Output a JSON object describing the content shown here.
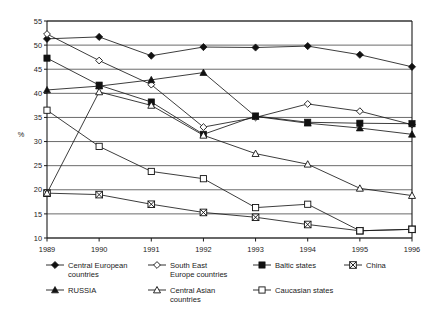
{
  "chart_data": {
    "type": "line",
    "title": "",
    "xlabel": "",
    "ylabel": "%",
    "categories": [
      "1989",
      "1990",
      "1991",
      "1992",
      "1993",
      "1994",
      "1995",
      "1996"
    ],
    "x": [
      1989,
      1990,
      1991,
      1992,
      1993,
      1994,
      1995,
      1996
    ],
    "ylim": [
      10,
      55
    ],
    "yticks": [
      "10",
      "15",
      "20",
      "25",
      "30",
      "35",
      "40",
      "45",
      "50",
      "55"
    ],
    "ytick_values": [
      10,
      15,
      20,
      25,
      30,
      35,
      40,
      45,
      50,
      55
    ],
    "grid": true,
    "legend_position": "bottom",
    "series": [
      {
        "name": "Central European countries",
        "marker": "diamond-filled",
        "values": [
          51.3,
          51.7,
          47.8,
          49.6,
          49.5,
          49.8,
          48.0,
          45.5
        ]
      },
      {
        "name": "South East Europe countries",
        "marker": "diamond-open",
        "values": [
          52.3,
          46.8,
          41.8,
          33.0,
          35.0,
          37.8,
          36.3,
          33.5
        ]
      },
      {
        "name": "Baltic states",
        "marker": "square-filled",
        "values": [
          47.3,
          41.7,
          38.2,
          31.5,
          35.3,
          34.0,
          33.8,
          33.7
        ]
      },
      {
        "name": "China",
        "marker": "square-crossed",
        "values": [
          19.3,
          19.0,
          17.0,
          15.3,
          14.3,
          12.8,
          11.5,
          11.8
        ]
      },
      {
        "name": "RUSSIA",
        "marker": "triangle-filled",
        "values": [
          40.7,
          41.5,
          42.8,
          44.3,
          35.2,
          33.8,
          32.8,
          31.5
        ]
      },
      {
        "name": "Central Asian countries",
        "marker": "triangle-open",
        "values": [
          19.3,
          40.3,
          37.5,
          31.3,
          27.5,
          25.3,
          20.3,
          18.8
        ]
      },
      {
        "name": "Caucasian states",
        "marker": "square-open",
        "values": [
          36.5,
          29.0,
          23.8,
          22.3,
          16.3,
          17.0,
          11.5,
          11.8
        ]
      }
    ]
  },
  "legend": {
    "entries": [
      {
        "label": "Central European countries",
        "marker": "diamond-filled"
      },
      {
        "label": "South East Europe countries",
        "marker": "diamond-open"
      },
      {
        "label": "Baltic states",
        "marker": "square-filled"
      },
      {
        "label": "China",
        "marker": "square-crossed"
      },
      {
        "label": "RUSSIA",
        "marker": "triangle-filled"
      },
      {
        "label": "Central Asian countries",
        "marker": "triangle-open"
      },
      {
        "label": "Caucasian states",
        "marker": "square-open"
      }
    ]
  },
  "colors": {
    "ink": "#111111",
    "grid": "#2b2b2b",
    "background": "#ffffff"
  }
}
